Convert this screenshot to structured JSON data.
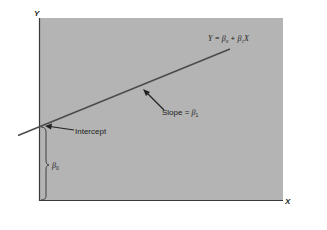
{
  "diagram": {
    "type": "linear-regression-line",
    "colors": {
      "background": "#ffffff",
      "plot_area": "#b4b4b4",
      "line": "#4a4a4a",
      "text": "#222222"
    },
    "axes": {
      "x_label": "X",
      "y_label": "Y"
    },
    "equation": {
      "lhs": "Y = ",
      "beta": "β",
      "sub0": "0",
      "plus": " + ",
      "sub1": "1",
      "x": "X"
    },
    "annotations": {
      "slope_text": "Slope = ",
      "slope_beta": "β",
      "slope_sub": "1",
      "intercept_text": "Intercept",
      "beta0_beta": "β",
      "beta0_sub": "0"
    }
  }
}
